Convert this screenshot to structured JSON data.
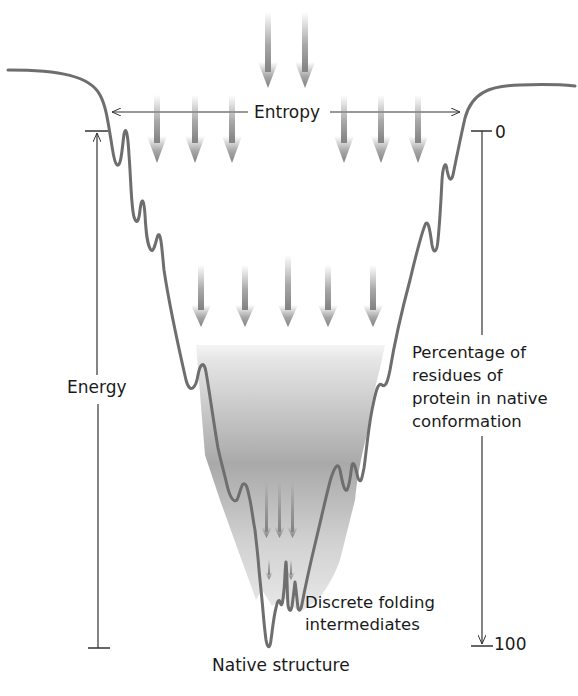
{
  "diagram": {
    "type": "protein-folding-energy-landscape-funnel",
    "labels": {
      "entropy": "Entropy",
      "energy": "Energy",
      "percentage_axis": "Percentage of\nresidues of\nprotein in native\nconformation",
      "discrete_intermediates": "Discrete folding\nintermediates",
      "native_structure": "Native structure",
      "axis_top_value": "0",
      "axis_bottom_value": "100"
    },
    "axes": {
      "entropy": {
        "label": "Entropy",
        "orientation": "horizontal",
        "direction": "double-headed"
      },
      "energy": {
        "label": "Energy",
        "orientation": "vertical",
        "arrow": "up"
      },
      "percentage": {
        "label": "Percentage of residues of protein in native conformation",
        "orientation": "vertical",
        "range": [
          "0",
          "100"
        ],
        "arrow": "down"
      }
    },
    "arrow_rows": [
      {
        "level": "top",
        "count": 2
      },
      {
        "level": "upper",
        "count": 6
      },
      {
        "level": "middle",
        "count": 5
      },
      {
        "level": "lower",
        "count": 3
      },
      {
        "level": "bottom",
        "count": 2
      }
    ],
    "colors": {
      "curve": "#6e6e6e",
      "arrow": "#8a8a8a",
      "funnel_fill_dark": "#a9a9a9",
      "text": "#1a1a1a",
      "axis_line": "#333333"
    }
  }
}
